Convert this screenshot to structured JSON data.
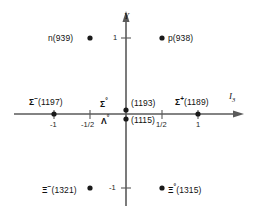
{
  "figure": {
    "type": "scatter",
    "axes": {
      "x": {
        "label": "I",
        "subscript": "3",
        "ticks": [
          "-1",
          "-1/2",
          "1/2",
          "1"
        ],
        "tick_values": [
          -1,
          -0.5,
          0.5,
          1
        ],
        "range": [
          -1.45,
          1.45
        ]
      },
      "y": {
        "label": "Y",
        "subscript": "",
        "ticks": [
          "1",
          "-1"
        ],
        "tick_values": [
          1,
          -1
        ],
        "range": [
          -1.5,
          1.5
        ]
      }
    },
    "points": [
      {
        "name": "neutron",
        "symbol": "n",
        "charge": "",
        "mass": "(939)",
        "i3": -0.5,
        "y": 1,
        "label_side": "left"
      },
      {
        "name": "proton",
        "symbol": "p",
        "charge": "",
        "mass": "(938)",
        "i3": 0.5,
        "y": 1,
        "label_side": "right"
      },
      {
        "name": "sigma-minus",
        "symbol": "Σ",
        "charge": "−",
        "mass": "(1197)",
        "i3": -1,
        "y": 0,
        "label_side": "above"
      },
      {
        "name": "sigma-zero",
        "symbol": "Σ",
        "charge": "°",
        "mass": "(1193)",
        "i3": 0,
        "y": 0,
        "label_side": "above"
      },
      {
        "name": "lambda-zero",
        "symbol": "Λ",
        "charge": "°",
        "mass": "(1115)",
        "i3": 0,
        "y": 0,
        "label_side": "below"
      },
      {
        "name": "sigma-plus",
        "symbol": "Σ",
        "charge": "+",
        "mass": "(1189)",
        "i3": 1,
        "y": 0,
        "label_side": "above"
      },
      {
        "name": "xi-minus",
        "symbol": "Ξ",
        "charge": "−",
        "mass": "(1321)",
        "i3": -0.5,
        "y": -1,
        "label_side": "left"
      },
      {
        "name": "xi-zero",
        "symbol": "Ξ",
        "charge": "°",
        "mass": "(1315)",
        "i3": 0.5,
        "y": -1,
        "label_side": "right"
      }
    ]
  },
  "labels": {
    "y_axis": "Y",
    "x_axis_main": "I",
    "x_axis_sub": "3",
    "n": "n",
    "n_mass": "(939)",
    "p": "p",
    "p_mass": "(938)",
    "sigma": "Σ",
    "lambda": "Λ",
    "xi": "Ξ",
    "minus": "−",
    "plus": "+",
    "zero": "°",
    "sigma_minus_mass": "(1197)",
    "sigma_zero_mass": "(1193)",
    "sigma_plus_mass": "(1189)",
    "lambda_zero_mass": "(1115)",
    "xi_minus_mass": "(1321)",
    "xi_zero_mass": "(1315)",
    "tick_neg_one_x": "-1",
    "tick_neg_half_x": "-1/2",
    "tick_half_x": "1/2",
    "tick_one_x": "1",
    "tick_one_y": "1",
    "tick_neg_one_y": "-1"
  },
  "colors": {
    "axis": "#5a5a5a",
    "point": "#1a1a1a",
    "text": "#111111",
    "background": "#ffffff"
  }
}
